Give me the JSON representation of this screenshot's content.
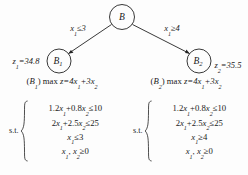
{
  "figure": {
    "type": "branch-and-bound-tree",
    "tree": {
      "root": {
        "label": "B",
        "label_base": "B",
        "label_sub": ""
      },
      "children": [
        {
          "label_base": "B",
          "label_sub": "1",
          "edge_label_base": "x",
          "edge_label_sub": "1",
          "edge_label_rel": "≤3",
          "edge_label_full": "x₁≤3",
          "bound_base": "z",
          "bound_sub": "1",
          "bound_value": "=34.8",
          "bound_full": "z₁=34.8"
        },
        {
          "label_base": "B",
          "label_sub": "2",
          "edge_label_base": "x",
          "edge_label_sub": "1",
          "edge_label_rel": "≥4",
          "edge_label_full": "x₁≥4",
          "bound_base": "z",
          "bound_sub": "2",
          "bound_value": "=35.5",
          "bound_full": "z₂=35.5"
        }
      ]
    },
    "subproblems": [
      {
        "name_open": "(",
        "name_base": "B",
        "name_sub": "1",
        "name_close": ")",
        "objective_prefix": "max ",
        "objective_z": "z",
        "objective_body": "=4x₁+3x₂",
        "objective_full": "(B₁) max z=4x₁+3x₂",
        "st_label": "s.t.",
        "constraints": [
          {
            "text": "1.2x₁+0.8x₂≤10",
            "lhs_c1": "1.2",
            "v1": "x",
            "v1sub": "1",
            "op": "+",
            "lhs_c2": "0.8",
            "v2": "x",
            "v2sub": "2",
            "rel": "≤",
            "rhs": "10"
          },
          {
            "text": "2x₁+2.5x₂≤25",
            "lhs_c1": "2",
            "v1": "x",
            "v1sub": "1",
            "op": "+",
            "lhs_c2": "2.5",
            "v2": "x",
            "v2sub": "2",
            "rel": "≤",
            "rhs": "25"
          },
          {
            "text": "x₁≤3",
            "v1": "x",
            "v1sub": "1",
            "rel": "≤",
            "rhs": "3"
          },
          {
            "text": "x₁, x₂≥0",
            "v1": "x",
            "v1sub": "1",
            "v2": "x",
            "v2sub": "2",
            "rel": "≥",
            "rhs": "0"
          }
        ]
      },
      {
        "name_open": "(",
        "name_base": "B",
        "name_sub": "2",
        "name_close": ")",
        "objective_prefix": "max ",
        "objective_z": "z",
        "objective_body": "=4x₁+3x₂",
        "objective_full": "(B₂) max z=4x₁+3x₂",
        "st_label": "s.t.",
        "constraints": [
          {
            "text": "1.2x₁+0.8x₂≤10",
            "lhs_c1": "1.2",
            "v1": "x",
            "v1sub": "1",
            "op": "+",
            "lhs_c2": "0.8",
            "v2": "x",
            "v2sub": "2",
            "rel": "≤",
            "rhs": "10"
          },
          {
            "text": "2x₁+2.5x₂≤25",
            "lhs_c1": "2",
            "v1": "x",
            "v1sub": "1",
            "op": "+",
            "lhs_c2": "2.5",
            "v2": "x",
            "v2sub": "2",
            "rel": "≤",
            "rhs": "25"
          },
          {
            "text": "x₁≥4",
            "v1": "x",
            "v1sub": "1",
            "rel": "≥",
            "rhs": "4"
          },
          {
            "text": "x₁, x₂≥0",
            "v1": "x",
            "v1sub": "1",
            "v2": "x",
            "v2sub": "2",
            "rel": "≥",
            "rhs": "0"
          }
        ]
      }
    ],
    "colors": {
      "background": "#fdfdfd",
      "ink": "#1a1a1a",
      "stroke": "#222222"
    }
  }
}
